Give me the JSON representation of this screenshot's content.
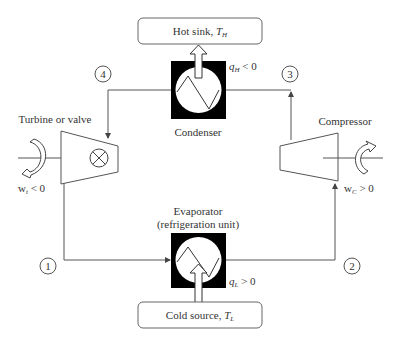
{
  "diagram": {
    "type": "refrigeration-cycle",
    "hot_sink": {
      "label": "Hot sink, ",
      "symbol": "T",
      "sub": "H"
    },
    "cold_source": {
      "label": "Cold source, ",
      "symbol": "T",
      "sub": "L"
    },
    "condenser": {
      "label": "Condenser",
      "heat_symbol": "q",
      "heat_sub": "H",
      "heat_relation": " < 0"
    },
    "evaporator": {
      "label_line1": "Evaporator",
      "label_line2": "(refrigeration unit)",
      "heat_symbol": "q",
      "heat_sub": "L",
      "heat_relation": " > 0"
    },
    "turbine": {
      "label": "Turbine or valve",
      "work_symbol": "w",
      "work_sub": "t",
      "work_relation": " < 0"
    },
    "compressor": {
      "label": "Compressor",
      "work_symbol": "w",
      "work_sub": "C",
      "work_relation": " > 0"
    },
    "states": [
      {
        "id": "1",
        "label": "1"
      },
      {
        "id": "2",
        "label": "2"
      },
      {
        "id": "3",
        "label": "3"
      },
      {
        "id": "4",
        "label": "4"
      }
    ],
    "colors": {
      "line": "#555555",
      "block": "#000000",
      "background": "#ffffff"
    }
  }
}
